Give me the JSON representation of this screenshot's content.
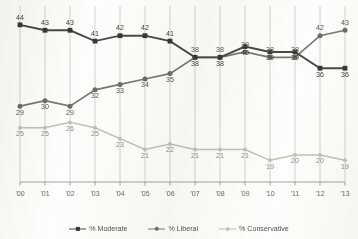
{
  "chart_data": {
    "type": "line",
    "title": "",
    "subtitle": "",
    "xlabel": "",
    "ylabel": "",
    "grid": "vertical-only",
    "legend_position": "bottom-center",
    "ylim": [
      15,
      46
    ],
    "x": [
      "'00",
      "'01",
      "'02",
      "'03",
      "'04",
      "'05",
      "'06",
      "'07",
      "'08",
      "'09",
      "'10",
      "'11",
      "'12",
      "'13"
    ],
    "categories": [
      "'00",
      "'01",
      "'02",
      "'03",
      "'04",
      "'05",
      "'06",
      "'07",
      "'08",
      "'09",
      "'10",
      "'11",
      "'12",
      "'13"
    ],
    "series": [
      {
        "name": "% Moderate",
        "color": "#4a4843",
        "marker": "square",
        "label_position": [
          "above",
          "above",
          "above",
          "above",
          "above",
          "above",
          "above",
          "below",
          "below",
          "below",
          "below",
          "below",
          "below",
          "below"
        ],
        "values": [
          44,
          43,
          43,
          41,
          42,
          42,
          41,
          38,
          38,
          40,
          39,
          39,
          36,
          36
        ]
      },
      {
        "name": "% Liberal",
        "color": "#7b7873",
        "marker": "circle",
        "label_position": [
          "below",
          "below",
          "below",
          "below",
          "below",
          "below",
          "below",
          "above",
          "above",
          "above",
          "above",
          "above",
          "above",
          "above"
        ],
        "values": [
          29,
          30,
          29,
          32,
          33,
          34,
          35,
          38,
          38,
          39,
          38,
          38,
          42,
          43
        ]
      },
      {
        "name": "% Conservative",
        "color": "#c2c0b9",
        "marker": "circle-small",
        "label_position": [
          "below",
          "below",
          "below",
          "below",
          "below",
          "below",
          "below",
          "below",
          "below",
          "below",
          "below",
          "below",
          "below",
          "below"
        ],
        "values": [
          25,
          25,
          26,
          25,
          23,
          21,
          22,
          21,
          21,
          21,
          19,
          20,
          20,
          19
        ]
      }
    ]
  },
  "legend": {
    "items": [
      {
        "label": "% Moderate"
      },
      {
        "label": "% Liberal"
      },
      {
        "label": "% Conservative"
      }
    ]
  }
}
